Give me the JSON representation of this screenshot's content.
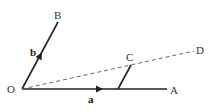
{
  "diagram": {
    "points": {
      "O": {
        "label": "O",
        "x": 22,
        "y": 89
      },
      "A": {
        "label": "A",
        "x": 167,
        "y": 89
      },
      "B": {
        "label": "B",
        "x": 58,
        "y": 22
      },
      "C": {
        "label": "C",
        "x": 131,
        "y": 65
      },
      "D": {
        "label": "D",
        "x": 194,
        "y": 51
      },
      "M": {
        "x": 118,
        "y": 89
      }
    },
    "vectors": {
      "a": {
        "label": "a"
      },
      "b": {
        "label": "b"
      }
    },
    "colors": {
      "line": "#222222",
      "dashed": "#666666",
      "background": "#ffffff"
    }
  }
}
